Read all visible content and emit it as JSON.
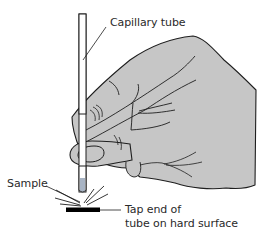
{
  "figure": {
    "type": "technical-illustration",
    "labels": {
      "capillary_tube": "Capillary tube",
      "sample": "Sample",
      "tap_line1": "Tap end of",
      "tap_line2": "tube on hard surface"
    },
    "colors": {
      "hand_fill": "#c6c6c6",
      "outline": "#1e1e1e",
      "sample_fill": "#a8b4c4",
      "surface": "#000000",
      "background": "#ffffff",
      "label_text": "#2a2a2a"
    }
  }
}
